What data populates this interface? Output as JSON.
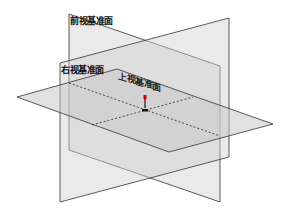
{
  "diagram": {
    "type": "3d-reference-planes",
    "planes": [
      {
        "id": "front",
        "label": "前视基准面",
        "points": "69,14 220,66 220,202 69,150",
        "fill": "#d9d9d9",
        "opacity": 0.55
      },
      {
        "id": "right",
        "label": "右视基准面",
        "points": "60,63 229,18 229,157 60,202",
        "fill": "#d2d2d2",
        "opacity": 0.45
      },
      {
        "id": "top",
        "label": "上视基准面",
        "points": "17,97 117,69 273,124 169,152",
        "fill": "#cfcfcf",
        "opacity": 0.55
      }
    ],
    "origin": {
      "x": 145,
      "y": 110
    },
    "colors": {
      "edge": "#333333",
      "dashed": "#222222",
      "background": "#ffffff"
    }
  },
  "labels": {
    "front": "前视基准面",
    "right": "右视基准面",
    "top": "上视基准面"
  }
}
